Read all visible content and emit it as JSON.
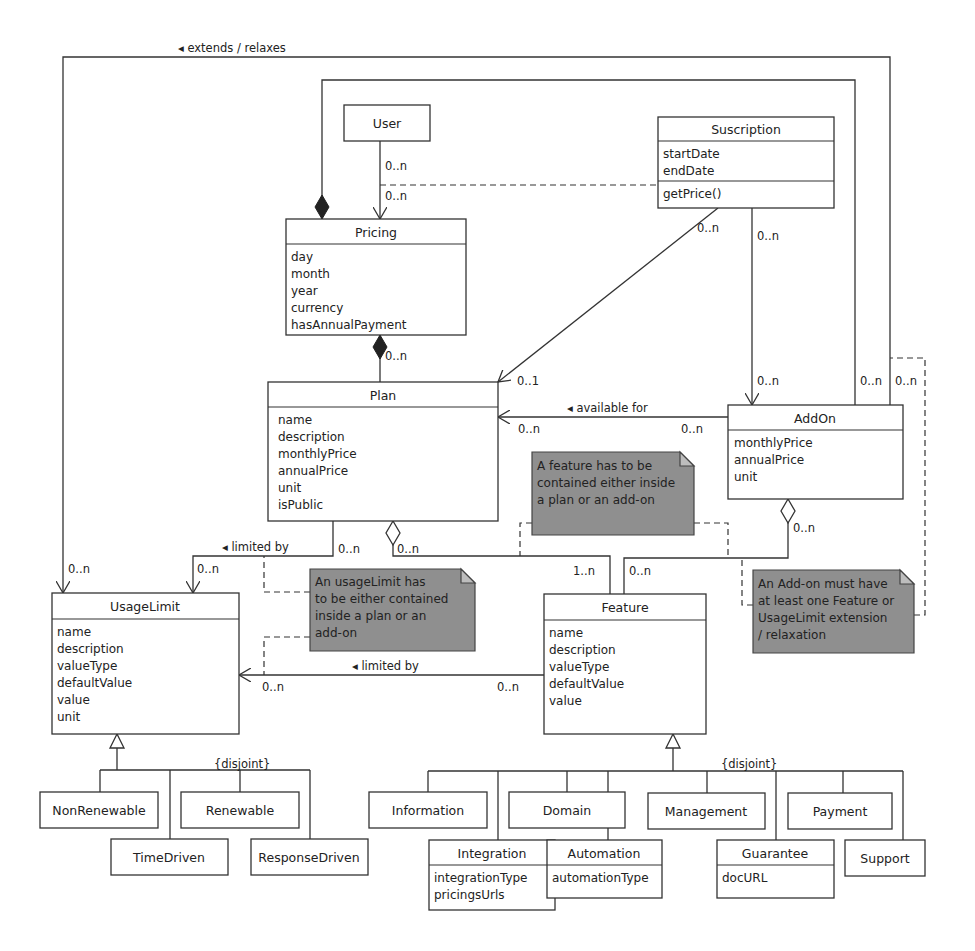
{
  "diagram": {
    "type": "UML class diagram",
    "classes": {
      "user": {
        "name": "User",
        "attributes": []
      },
      "suscription": {
        "name": "Suscription",
        "attributes": [
          "startDate",
          "endDate"
        ],
        "methods": [
          "getPrice()"
        ]
      },
      "pricing": {
        "name": "Pricing",
        "attributes": [
          "day",
          "month",
          "year",
          "currency",
          "hasAnnualPayment"
        ]
      },
      "plan": {
        "name": "Plan",
        "attributes": [
          "name",
          "description",
          "monthlyPrice",
          "annualPrice",
          "unit",
          "isPublic"
        ]
      },
      "addon": {
        "name": "AddOn",
        "attributes": [
          "monthlyPrice",
          "annualPrice",
          "unit"
        ]
      },
      "usagelimit": {
        "name": "UsageLimit",
        "attributes": [
          "name",
          "description",
          "valueType",
          "defaultValue",
          "value",
          "unit"
        ]
      },
      "feature": {
        "name": "Feature",
        "attributes": [
          "name",
          "description",
          "valueType",
          "defaultValue",
          "value"
        ]
      },
      "nonrenewable": {
        "name": "NonRenewable"
      },
      "renewable": {
        "name": "Renewable"
      },
      "timedriven": {
        "name": "TimeDriven"
      },
      "responsedriven": {
        "name": "ResponseDriven"
      },
      "information": {
        "name": "Information"
      },
      "domain": {
        "name": "Domain"
      },
      "management": {
        "name": "Management"
      },
      "payment": {
        "name": "Payment"
      },
      "integration": {
        "name": "Integration",
        "attributes": [
          "integrationType",
          "pricingsUrls"
        ]
      },
      "automation": {
        "name": "Automation",
        "attributes": [
          "automationType"
        ]
      },
      "guarantee": {
        "name": "Guarantee",
        "attributes": [
          "docURL"
        ]
      },
      "support": {
        "name": "Support"
      }
    },
    "associations": {
      "extends_relaxes": "◂ extends / relaxes",
      "available_for": "◂ available for",
      "limited_by_plan": "◂ limited by",
      "limited_by_feature": "◂ limited by"
    },
    "multiplicities": {
      "user_pricing_src": "0..n",
      "user_pricing_dst": "0..n",
      "pricing_plan": "0..n",
      "sus_plan_src": "0..n",
      "sus_plan_dst": "0..1",
      "sus_addon": "0..n",
      "addon_ext_a": "0..n",
      "addon_ext_b": "0..n",
      "avail_plan": "0..n",
      "avail_addon": "0..n",
      "plan_feature": "0..n",
      "plan_ul_src": "0..n",
      "plan_ul_dst": "0..n",
      "ext_ul": "0..n",
      "feature_1n": "1..n",
      "feature_0n": "0..n",
      "addon_feature": "0..n",
      "feat_ul_dst": "0..n",
      "feat_ul_src": "0..n"
    },
    "constraints": {
      "ul_disjoint": "{disjoint}",
      "feature_disjoint": "{disjoint}"
    },
    "notes": {
      "feature_note": [
        "A feature has to be",
        "contained either inside",
        "a plan or an add-on"
      ],
      "usagelimit_note": [
        "An usageLimit has",
        "to be either contained",
        "inside a plan or an",
        "add-on"
      ],
      "addon_note": [
        "An Add-on must have",
        "at least one Feature or",
        " UsageLimit extension",
        "/ relaxation"
      ]
    },
    "colors": {
      "line": "#333333",
      "note_fill": "#8f8f8f",
      "background": "#ffffff"
    }
  }
}
